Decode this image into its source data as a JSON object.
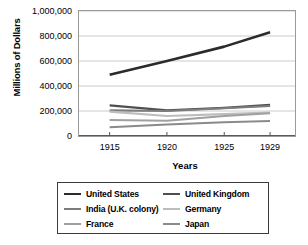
{
  "chart_data": {
    "type": "line",
    "title": "",
    "xlabel": "Years",
    "ylabel": "Millions of Dollars",
    "x": [
      1915,
      1920,
      1925,
      1929
    ],
    "xticklabels": [
      "1915",
      "1920",
      "1925",
      "1929"
    ],
    "xlim": [
      1912.5,
      1931.0
    ],
    "ylim": [
      0,
      1000000
    ],
    "yticks": [
      0,
      200000,
      400000,
      600000,
      800000,
      1000000
    ],
    "yticklabels": [
      "0",
      "200,000",
      "400,000",
      "600,000",
      "800,000",
      "1,000,000"
    ],
    "grid": "horizontal",
    "legend_position": "below-plot",
    "legend_columns": 2,
    "series": [
      {
        "name": "United States",
        "color": "#2b2b2b",
        "width": 2.6,
        "values": [
          490000,
          600000,
          715000,
          830000
        ]
      },
      {
        "name": "United Kingdom",
        "color": "#4f4f4f",
        "width": 2.3,
        "values": [
          245000,
          205000,
          225000,
          248000
        ]
      },
      {
        "name": "India (U.K. colony)",
        "color": "#7d7d7d",
        "width": 2.1,
        "values": [
          205000,
          200000,
          222000,
          240000
        ]
      },
      {
        "name": "Germany",
        "color": "#bdbdbd",
        "width": 2.1,
        "values": [
          195000,
          160000,
          175000,
          188000
        ]
      },
      {
        "name": "France",
        "color": "#a0a0a0",
        "width": 2.1,
        "values": [
          128000,
          122000,
          160000,
          182000
        ]
      },
      {
        "name": "Japan",
        "color": "#8a8a8a",
        "width": 2.1,
        "values": [
          70000,
          92000,
          110000,
          120000
        ]
      }
    ]
  }
}
